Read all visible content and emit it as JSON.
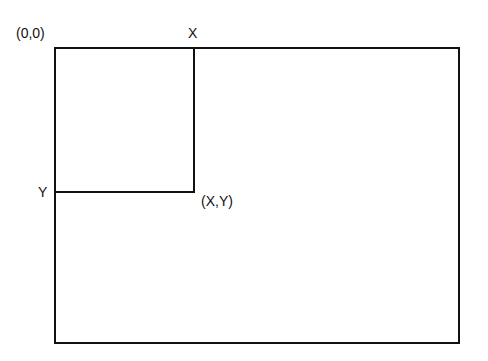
{
  "diagram": {
    "type": "coordinate-system-rectangle",
    "labels": {
      "origin": "(0,0)",
      "x_axis": "X",
      "y_axis": "Y",
      "point": "(X,Y)"
    },
    "colors": {
      "stroke": "#111111",
      "background": "#ffffff"
    }
  }
}
